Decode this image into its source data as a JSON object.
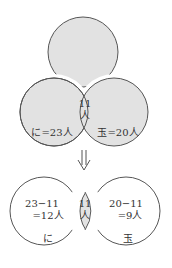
{
  "colors": {
    "shaded_fill": "#e2e2e2",
    "stroke": "#555555",
    "background": "#ffffff",
    "text": "#333333"
  },
  "top_diagram": {
    "left_set": {
      "label": "に=23人",
      "name": "に",
      "count": 23
    },
    "right_set": {
      "label": "玉=20人",
      "name": "玉",
      "count": 20
    },
    "intersection": {
      "line1": "11",
      "line2": "人",
      "count": 11
    }
  },
  "arrow": {
    "symbol": "⇓",
    "meaning": "down-double-arrow"
  },
  "bottom_diagram": {
    "left_only": {
      "line1": "23−11",
      "line2": "=12人",
      "name": "に",
      "count": 12
    },
    "intersection": {
      "line1": "11",
      "line2": "人",
      "count": 11
    },
    "right_only": {
      "line1": "20−11",
      "line2": "=9人",
      "name": "玉",
      "count": 9
    }
  }
}
